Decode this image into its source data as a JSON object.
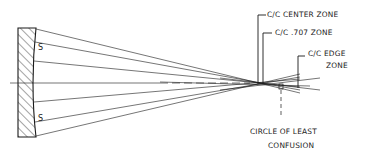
{
  "diagram": {
    "type": "optics-ray-diagram",
    "mirror_labels": {
      "upper_s": "S",
      "lower_s": "S"
    },
    "labels": {
      "center_zone": "C/C CENTER ZONE",
      "zone_707": "C/C .707 ZONE",
      "edge_zone_line1": "C/C EDGE",
      "edge_zone_line2": "ZONE",
      "circle_line1": "CIRCLE OF LEAST",
      "circle_line2": "CONFUSION"
    },
    "colors": {
      "ink": "#1a1a1a",
      "background": "#ffffff"
    }
  }
}
